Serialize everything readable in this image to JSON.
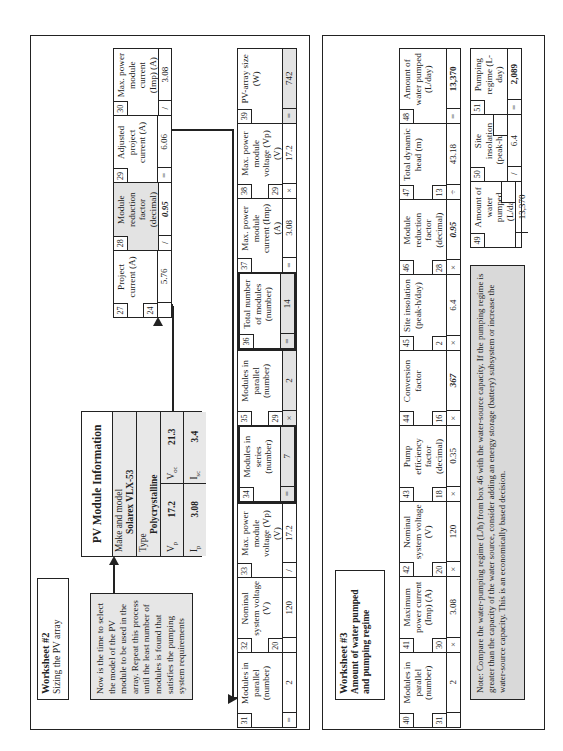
{
  "worksheet2": {
    "title": "Worksheet #2",
    "subtitle": "Sizing the PV array",
    "instruction": "Now is the time to select the model of the PV module to be used in the array. Repeat this process until the least number of modules is found that satisfies the pumping system requirements",
    "pv_module_info": {
      "header": "PV Module Information",
      "make_model_label": "Make and model",
      "make_model_value": "Solarex VLX-53",
      "type_label": "Type",
      "type_value": "Polycrystalline",
      "vp_label": "V",
      "vp_sub": "p",
      "vp_value": "17.2",
      "voc_label": "V",
      "voc_sub": "oc",
      "voc_value": "21.3",
      "ip_label": "I",
      "ip_sub": "p",
      "ip_value": "3.08",
      "isc_label": "I",
      "isc_sub": "sc",
      "isc_value": "3.4"
    },
    "row1": [
      {
        "num": "27",
        "label": "Project current (A)",
        "ref": "24",
        "op": "",
        "value": "5.76"
      },
      {
        "num": "28",
        "label": "Module reduction factor (decimal)",
        "ref": "",
        "op": "/",
        "value": "0.95",
        "shaded": true,
        "style": "ital"
      },
      {
        "num": "29",
        "label": "Adjusted project current (A)",
        "ref": "",
        "op": "=",
        "value": "6.06"
      },
      {
        "num": "30",
        "label": "Max. power module current (Imp) (A)",
        "ref": "",
        "op": "/",
        "value": "3.08"
      }
    ],
    "row2": [
      {
        "num": "31",
        "label": "Modules in parallel (number)",
        "ref": "",
        "op": "=",
        "value": "2"
      },
      {
        "num": "32",
        "label": "Nominal system voltage (V)",
        "ref": "20",
        "op": "",
        "value": "120"
      },
      {
        "num": "33",
        "label": "Max. power module voltage (Vp) (V)",
        "ref": "",
        "op": "/",
        "value": "17.2"
      },
      {
        "num": "34",
        "label": "Modules in series (number)",
        "ref": "",
        "op": "=",
        "value": "7"
      },
      {
        "num": "35",
        "label": "Modules in parallel (number)",
        "ref": "29",
        "op": "×",
        "value": "2"
      },
      {
        "num": "36",
        "label": "Total number of modules (number)",
        "ref": "",
        "op": "=",
        "value": "14"
      },
      {
        "num": "37",
        "label": "Max. power module current (Imp) (A)",
        "ref": "",
        "op": "=",
        "value": "3.08"
      },
      {
        "num": "38",
        "label": "Max. power module voltage (Vp) (V)",
        "ref": "29",
        "op": "×",
        "value": "17.2"
      },
      {
        "num": "39",
        "label": "PV-array size (W)",
        "ref": "",
        "op": "=",
        "value": "742"
      }
    ]
  },
  "worksheet3": {
    "title": "Worksheet #3",
    "subtitle": "Amount of water pumped and pumping regime",
    "row1": [
      {
        "num": "40",
        "label": "Modules in parallel (number)",
        "ref": "31",
        "op": "",
        "value": "2"
      },
      {
        "num": "41",
        "label": "Maximum power current (Imp) (A)",
        "ref": "30",
        "op": "×",
        "value": "3.08"
      },
      {
        "num": "42",
        "label": "Nominal system voltage (V)",
        "ref": "20",
        "op": "×",
        "value": "120"
      },
      {
        "num": "43",
        "label": "Pump efficiency factor (decimal)",
        "ref": "18",
        "op": "×",
        "value": "0.35"
      },
      {
        "num": "44",
        "label": "Conversion factor",
        "ref": "16",
        "op": "×",
        "value": "367",
        "style": "ital"
      },
      {
        "num": "45",
        "label": "Site insolation (peak-h/day)",
        "ref": "2",
        "op": "×",
        "value": "6.4"
      },
      {
        "num": "46",
        "label": "Module reduction factor (decimal)",
        "ref": "28",
        "op": "×",
        "value": "0.95",
        "style": "ital"
      },
      {
        "num": "47",
        "label": "Total dynamic head (m)",
        "ref": "13",
        "op": "÷",
        "value": "43.18"
      },
      {
        "num": "48",
        "label": "Amount of water pumped (L/day)",
        "ref": "",
        "op": "=",
        "value": "13,370",
        "style": "bold"
      }
    ],
    "row2": [
      {
        "num": "49",
        "label": "Amount of water pumped (L/day)",
        "ref": "",
        "op": "",
        "value": "13,370"
      },
      {
        "num": "50",
        "label": "Site insolation (peak-h/day)",
        "ref": "",
        "op": "/",
        "value": "6.4"
      },
      {
        "num": "51",
        "label": "Pumping regime (L-day)",
        "ref": "",
        "op": "=",
        "value": "2,089",
        "style": "bold"
      }
    ],
    "note": "Note: Compare the water-pumping regime (L/h) from box 46 with the water-source capacity. If the pumping regime is greater than the capacity of the water source, consider adding an energy storage (battery) subsystem or increase the water-source capacity. This is an economically based decision."
  }
}
